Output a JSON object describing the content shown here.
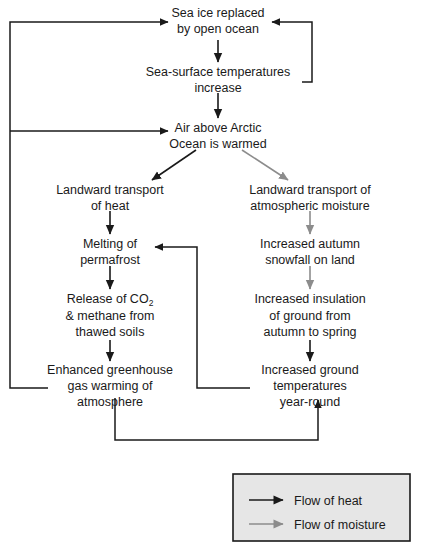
{
  "diagram": {
    "type": "flowchart",
    "title_visible": false,
    "colors": {
      "heat_flow": "#1a1a1a",
      "moisture_flow": "#8c8c8c",
      "text": "#1a1a1a",
      "legend_background": "#e6e6e6",
      "legend_border": "#1a1a1a",
      "page_background": "#ffffff"
    },
    "nodes": [
      {
        "id": "sea-ice-replaced",
        "lines": [
          "Sea ice replaced",
          "by open ocean"
        ],
        "x": 218,
        "y": 22
      },
      {
        "id": "sea-surface-temperatures",
        "lines": [
          "Sea-surface temperatures",
          "increase"
        ],
        "x": 218,
        "y": 75
      },
      {
        "id": "air-above-arctic-ocean",
        "lines": [
          "Air above Arctic",
          "Ocean is warmed"
        ],
        "x": 218,
        "y": 131
      },
      {
        "id": "landward-transport-heat",
        "lines": [
          "Landward transport",
          "of heat"
        ],
        "x": 110,
        "y": 193
      },
      {
        "id": "landward-transport-moisture",
        "lines": [
          "Landward transport of",
          "atmospheric moisture"
        ],
        "x": 310,
        "y": 193
      },
      {
        "id": "melting-permafrost",
        "lines": [
          "Melting of",
          "permafrost"
        ],
        "x": 110,
        "y": 247
      },
      {
        "id": "increased-autumn-snowfall",
        "lines": [
          "Increased autumn",
          "snowfall on land"
        ],
        "x": 310,
        "y": 247
      },
      {
        "id": "release-of-co2-methane",
        "lines": [
          "Release of CO2",
          "& methane from",
          "thawed soils"
        ],
        "x": 110,
        "y": 302
      },
      {
        "id": "increased-insulation-ground",
        "lines": [
          "Increased insulation",
          "of ground from",
          "autumn to spring"
        ],
        "x": 310,
        "y": 302
      },
      {
        "id": "enhanced-greenhouse-warming",
        "lines": [
          "Enhanced greenhouse",
          "gas warming of",
          "atmosphere"
        ],
        "x": 110,
        "y": 373
      },
      {
        "id": "increased-ground-temperatures",
        "lines": [
          "Increased ground",
          "temperatures",
          "year-round"
        ],
        "x": 310,
        "y": 373
      }
    ],
    "node_text": {
      "sea_ice_l1": "Sea ice replaced",
      "sea_ice_l2": "by open ocean",
      "sst_l1": "Sea-surface temperatures",
      "sst_l2": "increase",
      "air_l1": "Air above Arctic",
      "air_l2": "Ocean is warmed",
      "lt_heat_l1": "Landward transport",
      "lt_heat_l2": "of heat",
      "lt_moist_l1": "Landward transport of",
      "lt_moist_l2": "atmospheric moisture",
      "melting_l1": "Melting of",
      "melting_l2": "permafrost",
      "snowfall_l1": "Increased autumn",
      "snowfall_l2": "snowfall on land",
      "release_l1_pre": "Release of CO",
      "release_l1_sub": "2",
      "release_l2": "& methane from",
      "release_l3": "thawed soils",
      "insulation_l1": "Increased insulation",
      "insulation_l2": "of ground from",
      "insulation_l3": "autumn to spring",
      "greenhouse_l1": "Enhanced greenhouse",
      "greenhouse_l2": "gas warming of",
      "greenhouse_l3": "atmosphere",
      "groundtemp_l1": "Increased ground",
      "groundtemp_l2": "temperatures",
      "groundtemp_l3": "year-round"
    },
    "edges": [
      {
        "id": "sea-ice-to-sst",
        "from": "sea-ice-replaced",
        "to": "sea-surface-temperatures",
        "flow": "heat"
      },
      {
        "id": "sst-to-air",
        "from": "sea-surface-temperatures",
        "to": "air-above-arctic-ocean",
        "flow": "heat"
      },
      {
        "id": "air-to-lt-heat",
        "from": "air-above-arctic-ocean",
        "to": "landward-transport-heat",
        "flow": "heat"
      },
      {
        "id": "air-to-lt-moisture",
        "from": "air-above-arctic-ocean",
        "to": "landward-transport-moisture",
        "flow": "moisture"
      },
      {
        "id": "lt-heat-to-melting",
        "from": "landward-transport-heat",
        "to": "melting-permafrost",
        "flow": "heat"
      },
      {
        "id": "melting-to-release",
        "from": "melting-permafrost",
        "to": "release-of-co2-methane",
        "flow": "heat"
      },
      {
        "id": "release-to-greenhouse",
        "from": "release-of-co2-methane",
        "to": "enhanced-greenhouse-warming",
        "flow": "heat"
      },
      {
        "id": "lt-moisture-to-snowfall",
        "from": "landward-transport-moisture",
        "to": "increased-autumn-snowfall",
        "flow": "moisture"
      },
      {
        "id": "snowfall-to-insulation",
        "from": "increased-autumn-snowfall",
        "to": "increased-insulation-ground",
        "flow": "moisture"
      },
      {
        "id": "insulation-to-groundtemp",
        "from": "increased-insulation-ground",
        "to": "increased-ground-temperatures",
        "flow": "heat"
      },
      {
        "id": "greenhouse-to-sea-ice-feedback",
        "from": "enhanced-greenhouse-warming",
        "to": "sea-ice-replaced",
        "flow": "heat",
        "routing": "left-rail"
      },
      {
        "id": "greenhouse-to-air-feedback",
        "from": "enhanced-greenhouse-warming",
        "to": "air-above-arctic-ocean",
        "flow": "heat",
        "routing": "left-rail"
      },
      {
        "id": "sst-to-sea-ice-feedback",
        "from": "sea-surface-temperatures",
        "to": "sea-ice-replaced",
        "flow": "heat",
        "routing": "right-loop"
      },
      {
        "id": "groundtemp-to-melting-feedback",
        "from": "increased-ground-temperatures",
        "to": "melting-permafrost",
        "flow": "heat",
        "routing": "center-rail"
      },
      {
        "id": "greenhouse-to-groundtemp-feedback",
        "from": "enhanced-greenhouse-warming",
        "to": "increased-ground-temperatures",
        "flow": "heat",
        "routing": "bottom-rail"
      }
    ]
  },
  "legend": {
    "title_visible": false,
    "items": [
      {
        "id": "flow-of-heat",
        "label": "Flow of heat",
        "color": "#1a1a1a"
      },
      {
        "id": "flow-of-moisture",
        "label": "Flow of moisture",
        "color": "#8c8c8c"
      }
    ],
    "heat_label": "Flow of heat",
    "moisture_label": "Flow of moisture"
  }
}
